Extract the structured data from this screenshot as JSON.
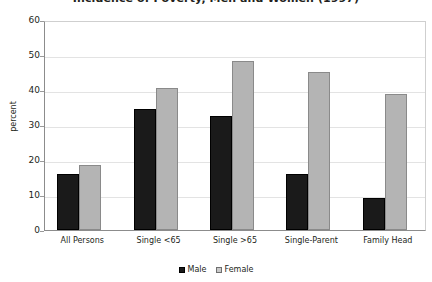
{
  "chart_data": {
    "type": "bar",
    "title": "Incidence of Poverty, Men and Women (1997)",
    "xlabel": "",
    "ylabel": "percent",
    "ylim": [
      0,
      60
    ],
    "ytick_step": 10,
    "ytick_labels": [
      "60",
      "50",
      "40",
      "30",
      "20",
      "10",
      "0"
    ],
    "ytick_values": [
      60,
      50,
      40,
      30,
      20,
      10,
      0
    ],
    "grid": true,
    "legend_position": "bottom-center",
    "categories": [
      "All Persons",
      "Single <65",
      "Single >65",
      "Single-Parent",
      "Family Head"
    ],
    "series": [
      {
        "name": "Male",
        "color": "#1a1a1a",
        "values": [
          16.0,
          34.6,
          32.6,
          16.0,
          9.1
        ]
      },
      {
        "name": "Female",
        "color": "#b4b4b4",
        "values": [
          18.7,
          40.6,
          48.3,
          45.1,
          38.9
        ]
      }
    ]
  }
}
